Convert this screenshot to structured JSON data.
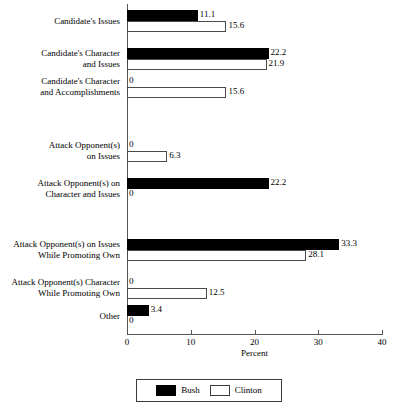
{
  "chart_data": {
    "type": "bar",
    "orientation": "horizontal",
    "title": "",
    "xlabel": "Percent",
    "ylabel": "",
    "xlim": [
      0,
      40
    ],
    "xticks": [
      0,
      10,
      20,
      30,
      40
    ],
    "xticklabels": [
      "0",
      "10",
      "20",
      "30",
      "40"
    ],
    "grid": false,
    "legend_position": "bottom-center",
    "categories": [
      "Candidate's Issues",
      "Candidate's Character\nand Issues",
      "Candidate's Character\nand Accomplishments",
      "Attack Opponent(s)\non Issues",
      "Attack Opponent(s) on\nCharacter and Issues",
      "Attack Opponent(s) on Issues\nWhile Promoting Own",
      "Attack Opponent(s) Character\nWhile Promoting Own",
      "Other"
    ],
    "series": [
      {
        "name": "Bush",
        "color": "#000000",
        "values": [
          11.1,
          22.2,
          0,
          0,
          22.2,
          33.3,
          0,
          3.4
        ],
        "labels": [
          "11.1",
          "22.2",
          "0",
          "0",
          "22.2",
          "33.3",
          "0",
          "3.4"
        ]
      },
      {
        "name": "Clinton",
        "color": "#ffffff",
        "values": [
          15.6,
          21.9,
          15.6,
          6.3,
          0,
          28.1,
          12.5,
          0
        ],
        "labels": [
          "15.6",
          "21.9",
          "15.6",
          "6.3",
          "0",
          "28.1",
          "12.5",
          "0"
        ]
      }
    ]
  },
  "legend": {
    "items": [
      {
        "label": "Bush",
        "swatch": "filled-black-swatch"
      },
      {
        "label": "Clinton",
        "swatch": "hollow-white-swatch"
      }
    ]
  }
}
